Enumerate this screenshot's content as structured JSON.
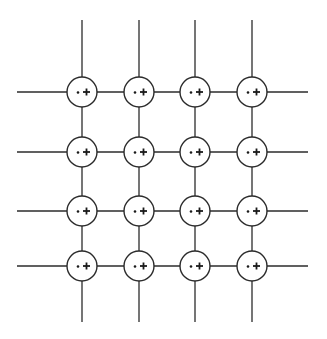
{
  "diagram": {
    "type": "lattice-grid",
    "rows": 4,
    "cols": 4,
    "column_x": [
      82,
      139,
      195,
      252
    ],
    "row_y": [
      92,
      152,
      211,
      266
    ],
    "node_radius": 15,
    "h_line_extent": [
      17,
      308
    ],
    "v_line_extent": [
      20,
      322
    ],
    "node_symbols": [
      "dot",
      "plus"
    ],
    "colors": {
      "stroke": "#2b2b2b",
      "fill": "#ffffff",
      "symbol": "#1a1a1a"
    }
  }
}
